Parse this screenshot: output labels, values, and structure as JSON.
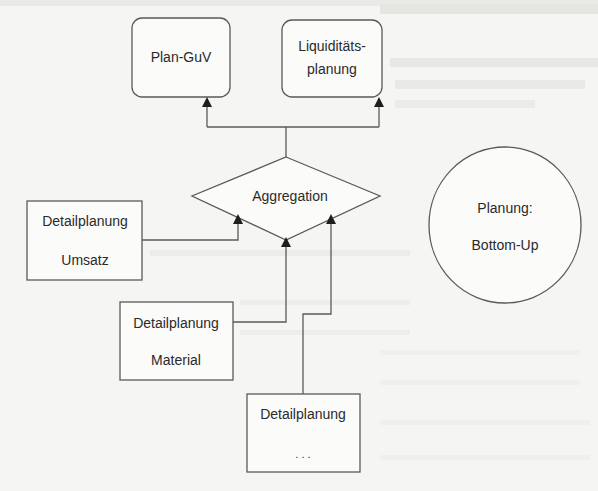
{
  "diagram": {
    "nodes": {
      "plan_guv": {
        "label": "Plan-GuV"
      },
      "liquiditaet": {
        "line1": "Liquiditäts-",
        "line2": "planung"
      },
      "aggregation": {
        "label": "Aggregation"
      },
      "umsatz": {
        "line1": "Detailplanung",
        "line2": "Umsatz"
      },
      "material": {
        "line1": "Detailplanung",
        "line2": "Material"
      },
      "weitere": {
        "line1": "Detailplanung",
        "line2": ". . ."
      },
      "planung_bottom_up": {
        "line1": "Planung:",
        "line2": "Bottom-Up"
      }
    },
    "edges": [
      {
        "from": "umsatz",
        "to": "aggregation"
      },
      {
        "from": "material",
        "to": "aggregation"
      },
      {
        "from": "weitere",
        "to": "aggregation"
      },
      {
        "from": "aggregation",
        "to": "plan_guv"
      },
      {
        "from": "aggregation",
        "to": "liquiditaet"
      }
    ],
    "colors": {
      "stroke": "#5a5a5a",
      "arrowhead": "#1e1e1e",
      "background": "#f5f5f3"
    }
  }
}
